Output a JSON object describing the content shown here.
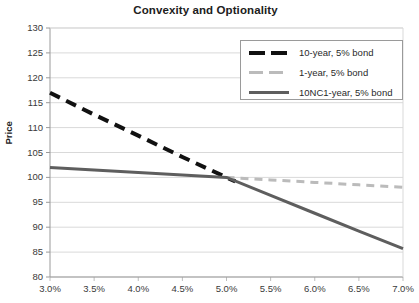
{
  "chart_data": {
    "type": "line",
    "title": "Convexity and Optionality",
    "xlabel": "",
    "ylabel": "Price",
    "grid": true,
    "legend_position": "top-right",
    "xlim": [
      3.0,
      7.0
    ],
    "ylim": [
      80,
      130
    ],
    "x": [
      3.0,
      3.5,
      4.0,
      4.5,
      5.0,
      5.5,
      6.0,
      6.5,
      7.0
    ],
    "xtick_labels": [
      "3.0%",
      "3.5%",
      "4.0%",
      "4.5%",
      "5.0%",
      "5.5%",
      "6.0%",
      "6.5%",
      "7.0%"
    ],
    "ytick_labels": [
      "130",
      "125",
      "120",
      "115",
      "110",
      "105",
      "100",
      "95",
      "90",
      "85",
      "80"
    ],
    "ytick_values": [
      130,
      125,
      120,
      115,
      110,
      105,
      100,
      95,
      90,
      85,
      80
    ],
    "series": [
      {
        "name": "10-year, 5% bond",
        "color": "#111111",
        "style": "dashed",
        "width": 4,
        "x": [
          3.0,
          3.5,
          4.0,
          4.5,
          5.0,
          5.1
        ],
        "values": [
          117.0,
          112.6,
          108.4,
          104.1,
          100.0,
          99.2
        ]
      },
      {
        "name": "1-year, 5% bond",
        "color": "#bbbbbb",
        "style": "dashed",
        "width": 3,
        "x": [
          5.0,
          5.5,
          6.0,
          6.5,
          7.0
        ],
        "values": [
          100.0,
          99.5,
          99.0,
          98.5,
          98.0
        ]
      },
      {
        "name": "10NC1-year, 5% bond",
        "color": "#5e5e5e",
        "style": "solid",
        "width": 3,
        "x": [
          3.0,
          3.5,
          4.0,
          4.5,
          5.0,
          5.5,
          6.0,
          6.5,
          7.0
        ],
        "values": [
          102.0,
          101.5,
          101.0,
          100.5,
          100.0,
          96.4,
          92.8,
          89.2,
          85.7
        ]
      }
    ]
  },
  "legend": {
    "entries": [
      {
        "label": "10-year, 5% bond"
      },
      {
        "label": "1-year, 5% bond"
      },
      {
        "label": "10NC1-year, 5% bond"
      }
    ]
  }
}
